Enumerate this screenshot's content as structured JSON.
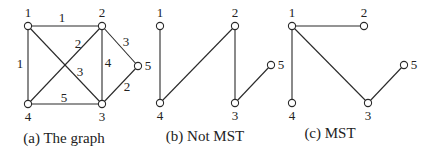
{
  "figure": {
    "panels": [
      {
        "id": "a",
        "caption": "(a) The graph",
        "caption_pos": [
          64,
          143
        ],
        "nodes": [
          {
            "id": "1",
            "label": "1",
            "x": 28,
            "y": 26,
            "lx": 28,
            "ly": 17
          },
          {
            "id": "2",
            "label": "2",
            "x": 102,
            "y": 26,
            "lx": 102,
            "ly": 17
          },
          {
            "id": "3",
            "label": "3",
            "x": 102,
            "y": 104,
            "lx": 102,
            "ly": 121
          },
          {
            "id": "4",
            "label": "4",
            "x": 28,
            "y": 104,
            "lx": 28,
            "ly": 121
          },
          {
            "id": "5",
            "label": "5",
            "x": 138,
            "y": 66,
            "lx": 148,
            "ly": 70
          }
        ],
        "edges": [
          {
            "from": "1",
            "to": "2",
            "weight": "1",
            "wx": 62,
            "wy": 22
          },
          {
            "from": "1",
            "to": "4",
            "weight": "1",
            "wx": 20,
            "wy": 68
          },
          {
            "from": "4",
            "to": "2",
            "weight": "2",
            "wx": 78,
            "wy": 48
          },
          {
            "from": "1",
            "to": "3",
            "weight": "3",
            "wx": 80,
            "wy": 76
          },
          {
            "from": "2",
            "to": "3",
            "weight": "4",
            "wx": 108,
            "wy": 67
          },
          {
            "from": "2",
            "to": "5",
            "weight": "3",
            "wx": 126,
            "wy": 46
          },
          {
            "from": "3",
            "to": "5",
            "weight": "2",
            "wx": 127,
            "wy": 91
          },
          {
            "from": "4",
            "to": "3",
            "weight": "5",
            "wx": 64,
            "wy": 102
          }
        ]
      },
      {
        "id": "b",
        "caption": "(b) Not MST",
        "caption_pos": [
          205,
          141
        ],
        "nodes": [
          {
            "id": "1",
            "label": "1",
            "x": 160,
            "y": 26,
            "lx": 160,
            "ly": 17
          },
          {
            "id": "2",
            "label": "2",
            "x": 235,
            "y": 26,
            "lx": 235,
            "ly": 17
          },
          {
            "id": "3",
            "label": "3",
            "x": 235,
            "y": 103,
            "lx": 235,
            "ly": 120
          },
          {
            "id": "4",
            "label": "4",
            "x": 160,
            "y": 103,
            "lx": 160,
            "ly": 120
          },
          {
            "id": "5",
            "label": "5",
            "x": 271,
            "y": 65,
            "lx": 281,
            "ly": 69
          }
        ],
        "edges": [
          {
            "from": "1",
            "to": "4"
          },
          {
            "from": "4",
            "to": "2"
          },
          {
            "from": "2",
            "to": "3"
          },
          {
            "from": "3",
            "to": "5"
          }
        ]
      },
      {
        "id": "c",
        "caption": "(c) MST",
        "caption_pos": [
          330,
          138
        ],
        "nodes": [
          {
            "id": "1",
            "label": "1",
            "x": 292,
            "y": 26,
            "lx": 292,
            "ly": 17
          },
          {
            "id": "2",
            "label": "2",
            "x": 364,
            "y": 26,
            "lx": 364,
            "ly": 17
          },
          {
            "id": "3",
            "label": "3",
            "x": 368,
            "y": 103,
            "lx": 368,
            "ly": 120
          },
          {
            "id": "4",
            "label": "4",
            "x": 292,
            "y": 103,
            "lx": 292,
            "ly": 120
          },
          {
            "id": "5",
            "label": "5",
            "x": 404,
            "y": 65,
            "lx": 414,
            "ly": 69
          }
        ],
        "edges": [
          {
            "from": "1",
            "to": "2"
          },
          {
            "from": "1",
            "to": "4"
          },
          {
            "from": "1",
            "to": "3"
          },
          {
            "from": "3",
            "to": "5"
          }
        ]
      }
    ],
    "colors": {
      "stroke": "#2a2a2a",
      "text": "#222222",
      "background": "#ffffff"
    }
  }
}
